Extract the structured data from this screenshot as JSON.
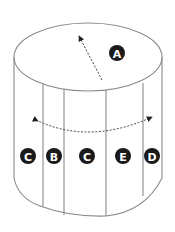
{
  "diagram": {
    "type": "cylinder-label-diagram",
    "top_label": {
      "text": "A",
      "cx": 117,
      "cy": 53
    },
    "side_labels": [
      {
        "text": "C",
        "cx": 28,
        "cy": 156
      },
      {
        "text": "B",
        "cx": 54,
        "cy": 156
      },
      {
        "text": "C",
        "cx": 87,
        "cy": 156
      },
      {
        "text": "E",
        "cx": 123,
        "cy": 156
      },
      {
        "text": "D",
        "cx": 152,
        "cy": 156
      }
    ],
    "colors": {
      "outline": "#8a8a8a",
      "arrow": "#444444",
      "badge": "#1a1a1a",
      "badge_text": "#ffffff"
    }
  }
}
